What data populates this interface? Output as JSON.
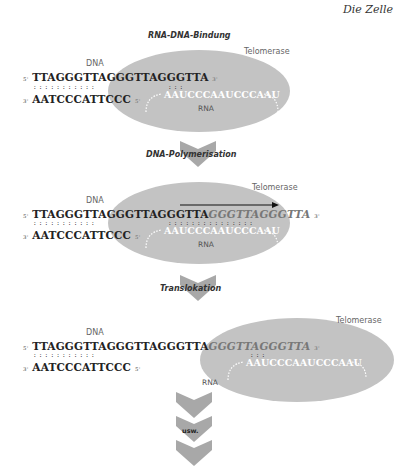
{
  "header": {
    "chapter": "Die Zelle"
  },
  "steps": [
    {
      "title": "RNA-DNA-Bindung",
      "enzyme_label": "Telomerase",
      "dna_label": "DNA",
      "rna_label": "RNA",
      "strand_top": {
        "five_prime": "5'",
        "sequence": "TTAGGGTTAGGGTTAGGGTTA",
        "new_sequence": "",
        "three_prime": "3'"
      },
      "strand_bottom": {
        "three_prime": "3'",
        "sequence": "AATCCCATTCCC",
        "five_prime": "5'"
      },
      "rna_sequence": "AAUCCCAAUCCCAAU"
    },
    {
      "title": "DNA-Polymerisation",
      "enzyme_label": "Telomerase",
      "dna_label": "DNA",
      "rna_label": "RNA",
      "strand_top": {
        "five_prime": "5'",
        "sequence": "TTAGGGTTAGGGTTAGGGTTA",
        "new_sequence": "GGGTTAGGGTTA",
        "three_prime": "3'"
      },
      "strand_bottom": {
        "three_prime": "3'",
        "sequence": "AATCCCATTCCC",
        "five_prime": "5'"
      },
      "rna_sequence": "AAUCCCAAUCCCAAU"
    },
    {
      "title": "Translokation",
      "enzyme_label": "Telomerase",
      "dna_label": "DNA",
      "rna_label": "RNA",
      "strand_top": {
        "five_prime": "5'",
        "sequence": "TTAGGGTTAGGGTTAGGGTTA",
        "new_sequence": "GGGTTAGGGTTA",
        "three_prime": "3'"
      },
      "strand_bottom": {
        "three_prime": "3'",
        "sequence": "AATCCCATTCCC",
        "five_prime": "5'"
      },
      "rna_sequence": "AAUCCCAAUCCCAAU"
    }
  ],
  "continuation": {
    "label": "usw."
  },
  "colors": {
    "enzyme": "#c3c3c3",
    "arrow": "#a8a8a8",
    "text": "#222222",
    "new_strand": "#777777"
  }
}
